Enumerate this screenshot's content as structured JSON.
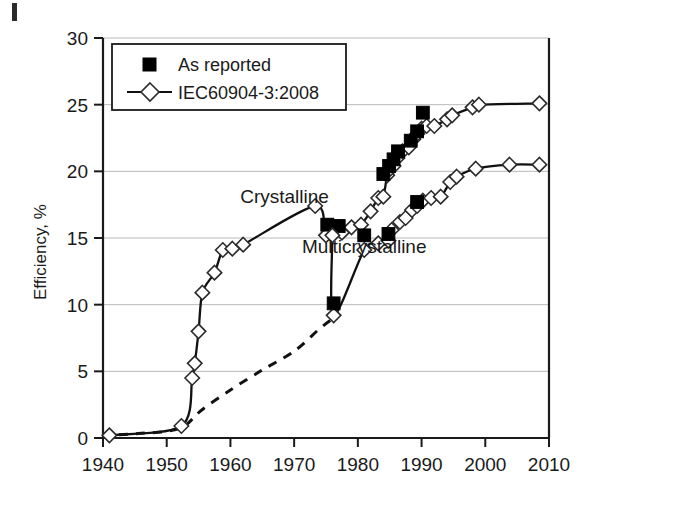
{
  "figure": {
    "background": "#ffffff",
    "ink_color": "#111111",
    "grid_color": "#b9b9b9",
    "corner_mark": "page-edge-mark"
  },
  "chart_data": {
    "type": "line",
    "title": "",
    "xlabel": "",
    "ylabel": "Efficiency, %",
    "xlim": [
      1940,
      2010
    ],
    "ylim": [
      0,
      30
    ],
    "xticks": [
      1940,
      1950,
      1960,
      1970,
      1980,
      1990,
      2000,
      2010
    ],
    "xtick_labels": [
      "1940",
      "1950",
      "1960",
      "1970",
      "1980",
      "1990",
      "2000",
      "2010"
    ],
    "yticks": [
      0,
      5,
      10,
      15,
      20,
      25,
      30
    ],
    "ytick_labels": [
      "0",
      "5",
      "10",
      "15",
      "20",
      "25",
      "30"
    ],
    "grid": "horizontal",
    "legend_position": "upper-left-inside",
    "legend": [
      {
        "label": "As reported",
        "marker": "filled-square"
      },
      {
        "label": "IEC60904-3:2008",
        "marker": "open-diamond-with-line"
      }
    ],
    "annotations": [
      {
        "text": "Crystalline",
        "x": 1968.5,
        "y": 17.6
      },
      {
        "text": "Multicrystalline",
        "x": 1981.0,
        "y": 13.9
      }
    ],
    "series": [
      {
        "name": "Crystalline (IEC60904-3:2008)",
        "marker": "open-diamond",
        "line": "solid",
        "x": [
          1941.0,
          1952.3,
          1954.0,
          1954.4,
          1955.0,
          1955.6,
          1957.5,
          1958.8,
          1960.3,
          1962.0,
          1973.3,
          1975.0,
          1977.5,
          1979.0,
          1980.5,
          1982.0,
          1983.2,
          1984.0,
          1984.6,
          1985.1,
          1985.6,
          1986.2,
          1987.0,
          1988.0,
          1988.7,
          1989.3,
          1990.0,
          1990.8,
          1992.0,
          1994.0,
          1994.8,
          1998.0,
          1999.0,
          2008.5
        ],
        "y": [
          0.2,
          0.9,
          4.5,
          5.6,
          8.0,
          10.9,
          12.4,
          14.1,
          14.2,
          14.5,
          17.4,
          15.2,
          15.4,
          15.8,
          16.0,
          17.0,
          18.0,
          18.1,
          19.7,
          20.2,
          20.4,
          21.0,
          21.5,
          21.8,
          22.4,
          22.8,
          23.2,
          23.4,
          23.4,
          23.9,
          24.2,
          24.8,
          25.0,
          25.1
        ]
      },
      {
        "name": "Crystalline (As reported)",
        "marker": "filled-square",
        "line": "none",
        "x": [
          1975.2,
          1977.0,
          1984.0,
          1984.9,
          1985.6,
          1986.3,
          1988.3,
          1989.3,
          1990.2
        ],
        "y": [
          16.0,
          15.9,
          19.8,
          20.4,
          20.9,
          21.5,
          22.3,
          23.0,
          24.4
        ]
      },
      {
        "name": "Multicrystalline (IEC60904-3:2008)",
        "marker": "open-diamond",
        "line": "solid",
        "x": [
          1976.0,
          1976.2,
          1981.0,
          1983.2,
          1984.8,
          1985.3,
          1986.6,
          1987.5,
          1988.5,
          1989.3,
          1990.2,
          1991.5,
          1993.0,
          1994.5,
          1995.5,
          1998.5,
          2003.8,
          2008.5
        ],
        "y": [
          15.2,
          9.2,
          14.1,
          14.6,
          14.8,
          15.6,
          16.2,
          16.5,
          17.1,
          17.4,
          17.8,
          18.0,
          18.1,
          19.2,
          19.6,
          20.2,
          20.5,
          20.5
        ]
      },
      {
        "name": "Multicrystalline (As reported)",
        "marker": "filled-square",
        "line": "none",
        "x": [
          1976.2,
          1981.0,
          1984.8,
          1989.3
        ],
        "y": [
          10.1,
          15.2,
          15.3,
          17.7
        ]
      },
      {
        "name": "Projection (dashed)",
        "marker": "none",
        "line": "dashed",
        "x": [
          1942.5,
          1946.0,
          1950.0,
          1952.8,
          1955.5,
          1960.0,
          1965.0,
          1970.0,
          1974.0,
          1976.2
        ],
        "y": [
          0.25,
          0.35,
          0.5,
          0.9,
          2.1,
          3.6,
          5.1,
          6.5,
          8.2,
          9.0
        ]
      }
    ]
  }
}
